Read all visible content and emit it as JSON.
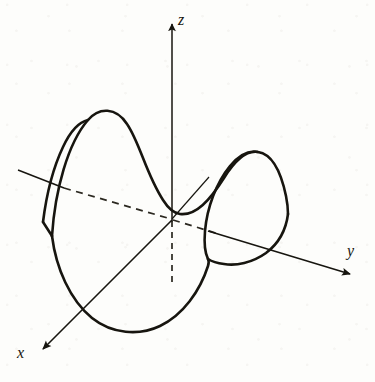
{
  "figure": {
    "kind": "math-diagram",
    "background_color": "#fdfdfb",
    "ink_color": "#17150f"
  },
  "axes": {
    "z": {
      "label": "z",
      "origin": [
        172,
        220
      ],
      "tip": [
        172,
        18
      ],
      "arrowhead": true,
      "style": "solid",
      "hidden_segment": {
        "from": [
          172,
          220
        ],
        "to": [
          172,
          286
        ],
        "style": "dashed"
      }
    },
    "y": {
      "label": "y",
      "origin": [
        172,
        220
      ],
      "tip": [
        356,
        276
      ],
      "arrowhead": true,
      "style": "solid",
      "hidden_segment": {
        "from": [
          172,
          220
        ],
        "to": [
          219,
          234
        ],
        "style": "dashed"
      },
      "negative_ray": {
        "from": [
          18,
          170
        ],
        "to": [
          64,
          188
        ],
        "style": "solid",
        "hidden_from": [
          64,
          188
        ],
        "hidden_to": [
          172,
          220
        ],
        "hidden_style": "dashed"
      }
    },
    "x": {
      "label": "x",
      "origin": [
        172,
        220
      ],
      "tip": [
        36,
        356
      ],
      "arrowhead": true,
      "style": "solid",
      "negative_ray": {
        "from": [
          172,
          220
        ],
        "to": [
          209,
          177
        ],
        "style": "solid-thin"
      }
    }
  },
  "surface": {
    "name": "saddle-surface",
    "description": "Closed wavy saddle-shaped sheet with a raised hump on the upper left, a raised hump on the upper right, and a dipping trough across the lower front.",
    "stroke_width": 2.6,
    "features": {
      "left_hump_peak": [
        105,
        113
      ],
      "right_hump_peak": [
        261,
        155
      ],
      "front_trough_bottom": [
        138,
        331
      ],
      "left_kink": [
        52,
        236
      ],
      "right_kink": [
        288,
        214
      ],
      "saddle_point": [
        178,
        214
      ]
    }
  },
  "labels": {
    "z": "z",
    "y": "y",
    "x": "x"
  }
}
